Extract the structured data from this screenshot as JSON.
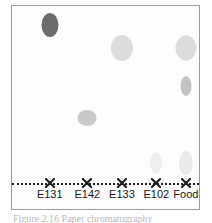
{
  "figure": {
    "caption": "Figure 2.16 Paper chromatography",
    "frame_color": "#9a9a9a",
    "plate_background": "#fdfdfd",
    "baseline_color": "#1a1a1a",
    "baseline_style": "dotted",
    "origin_marker_glyph": "x-cross"
  },
  "chart_data": {
    "type": "scatter",
    "title": "",
    "xlabel": "",
    "ylabel": "",
    "grid": false,
    "legend": false,
    "categories": [
      "E131",
      "E142",
      "E133",
      "E102",
      "Food"
    ],
    "lane_x_percent": [
      20.2,
      40.3,
      58.8,
      77.2,
      93.0
    ],
    "baseline_y_percent": 87.0,
    "series": [
      {
        "name": "spots",
        "points": [
          {
            "lane": "E131",
            "x_percent": 20.2,
            "y_percent": 9.6,
            "rf": 0.89,
            "width_px": 17,
            "height_px": 24,
            "color": "#6d6d6d",
            "intensity": "dark"
          },
          {
            "lane": "E142",
            "x_percent": 40.3,
            "y_percent": 55.0,
            "rf": 0.37,
            "width_px": 19,
            "height_px": 16,
            "color": "#c9c9c9",
            "intensity": "medium"
          },
          {
            "lane": "E133",
            "x_percent": 58.8,
            "y_percent": 20.5,
            "rf": 0.76,
            "width_px": 22,
            "height_px": 26,
            "color": "#dcdcdc",
            "intensity": "light"
          },
          {
            "lane": "E102",
            "x_percent": 77.2,
            "y_percent": 77.5,
            "rf": 0.11,
            "width_px": 12,
            "height_px": 21,
            "color": "#efefef",
            "intensity": "very-light"
          },
          {
            "lane": "Food",
            "x_percent": 93.0,
            "y_percent": 20.5,
            "rf": 0.76,
            "width_px": 21,
            "height_px": 25,
            "color": "#dcdcdc",
            "intensity": "light"
          },
          {
            "lane": "Food",
            "x_percent": 93.0,
            "y_percent": 39.5,
            "rf": 0.55,
            "width_px": 11,
            "height_px": 20,
            "color": "#c2c2c2",
            "intensity": "medium"
          },
          {
            "lane": "Food",
            "x_percent": 93.0,
            "y_percent": 77.5,
            "rf": 0.11,
            "width_px": 14,
            "height_px": 24,
            "color": "#eaeaea",
            "intensity": "very-light"
          }
        ]
      }
    ]
  }
}
